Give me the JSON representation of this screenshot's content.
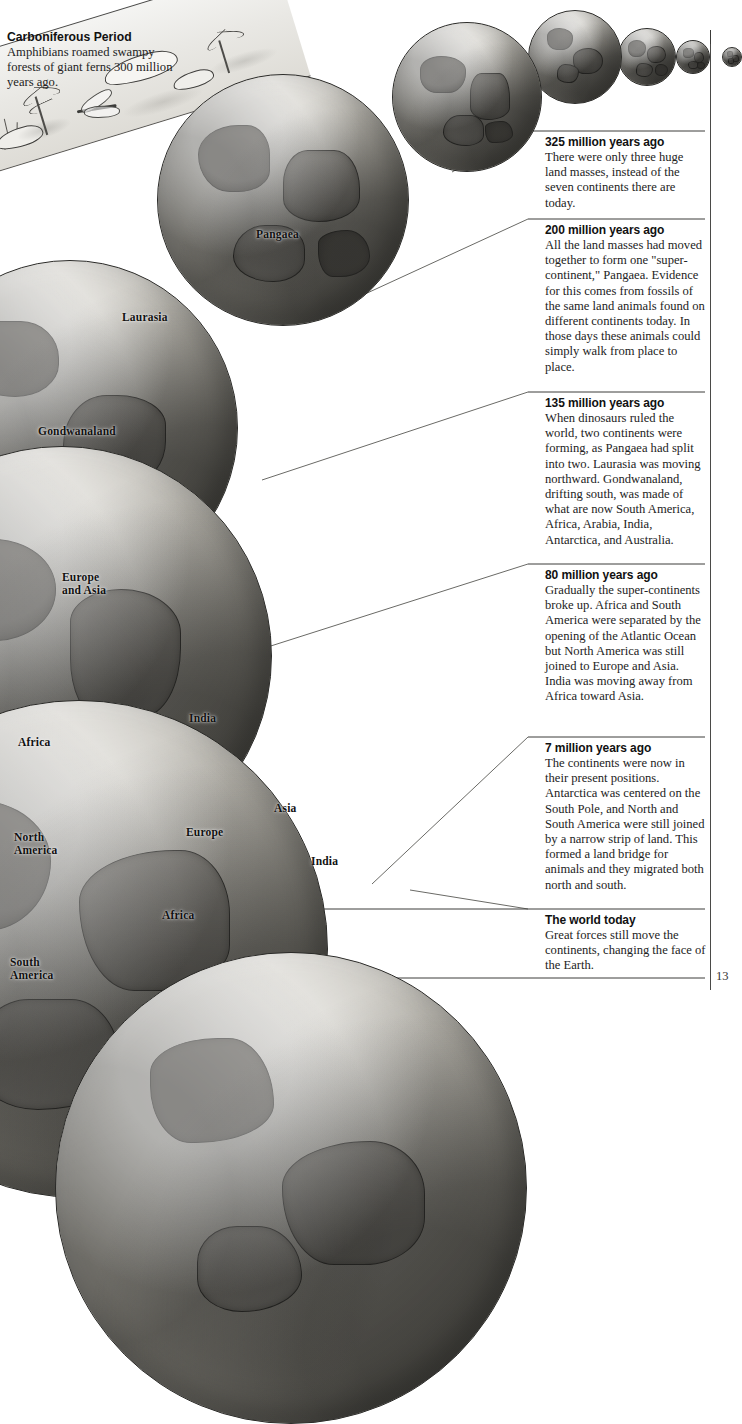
{
  "page": {
    "number": "13"
  },
  "header": {
    "title": "Carboniferous Period",
    "body": "Amphibians roamed swampy forests of giant ferns 300 million years ago."
  },
  "globe_labels": [
    {
      "text": "Pangaea",
      "x": 256,
      "y": 228
    },
    {
      "text": "Laurasia",
      "x": 122,
      "y": 311
    },
    {
      "text": "Gondwanaland",
      "x": 38,
      "y": 425
    },
    {
      "text": "Europe\nand Asia",
      "x": 62,
      "y": 571
    },
    {
      "text": "India",
      "x": 189,
      "y": 712
    },
    {
      "text": "Africa",
      "x": 18,
      "y": 736
    },
    {
      "text": "Asia",
      "x": 274,
      "y": 802
    },
    {
      "text": "Europe",
      "x": 186,
      "y": 826
    },
    {
      "text": "India",
      "x": 311,
      "y": 855
    },
    {
      "text": "North\nAmerica",
      "x": 14,
      "y": 831
    },
    {
      "text": "Africa",
      "x": 162,
      "y": 909
    },
    {
      "text": "South\nAmerica",
      "x": 10,
      "y": 956
    }
  ],
  "entries": [
    {
      "title": "325 million years ago",
      "body": "There were only three huge land masses, instead of the seven continents there are today.",
      "rule_y": 131,
      "top": 135
    },
    {
      "title": "200 million years ago",
      "body": "All the land masses had moved together to form one \"super-continent,\" Pangaea. Evidence for this comes from fossils of the same land animals found on different continents today. In those days these animals could simply walk from place to place.",
      "rule_y": 219,
      "top": 223
    },
    {
      "title": "135 million years ago",
      "body": "When dinosaurs ruled the world, two continents were forming, as Pangaea had split into two. Laurasia was moving northward. Gondwanaland, drifting south, was made of what are now South America, Africa, Arabia, India, Antarctica, and Australia.",
      "rule_y": 392,
      "top": 396
    },
    {
      "title": "80 million years ago",
      "body": "Gradually the super-continents broke up. Africa and South America were separated by the opening of the Atlantic Ocean but North America was still joined to Europe and Asia. India was moving away from Africa toward Asia.",
      "rule_y": 564,
      "top": 568
    },
    {
      "title": "7 million years ago",
      "body": "The continents were now in their present positions. Antarctica was centered on the South Pole, and North and South America were still joined by a narrow strip of land. This formed a land bridge for animals and they migrated both north and south.",
      "rule_y": 737,
      "top": 741
    },
    {
      "title": "The world today",
      "body": "Great forces still move the continents, changing the face of the Earth.",
      "rule_y": 909,
      "top": 913
    }
  ],
  "globes": [
    {
      "name": "globe-today-tiny",
      "x": 722,
      "y": 47,
      "d": 18
    },
    {
      "name": "globe-7m",
      "x": 676,
      "y": 40,
      "d": 32
    },
    {
      "name": "globe-80m",
      "x": 618,
      "y": 28,
      "d": 56
    },
    {
      "name": "globe-135m",
      "x": 528,
      "y": 10,
      "d": 92
    },
    {
      "name": "globe-200m",
      "x": 392,
      "y": 22,
      "d": 148
    },
    {
      "name": "globe-325m-pangaea",
      "x": 157,
      "y": 74,
      "d": 250
    },
    {
      "name": "globe-laurasia",
      "x": -98,
      "y": 260,
      "d": 334
    },
    {
      "name": "globe-europe-asia",
      "x": -148,
      "y": 446,
      "d": 418
    },
    {
      "name": "globe-modern",
      "x": -170,
      "y": 700,
      "d": 496
    },
    {
      "name": "globe-bottom",
      "x": 55,
      "y": 952,
      "d": 470
    }
  ],
  "colors": {
    "ink": "#1a1a1a",
    "rule": "#3c3c3a",
    "ocean_light": "#d9d7d1",
    "land": "#93908a",
    "land_dark": "#6e6b65",
    "paper": "#ffffff"
  },
  "icons": {
    "fern": "fern-icon",
    "amphibian": "amphibian-icon",
    "dragonfly": "dragonfly-icon"
  }
}
